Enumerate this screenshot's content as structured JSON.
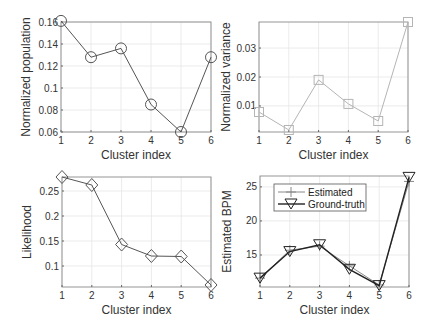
{
  "chart_data": [
    {
      "id": "population",
      "type": "line",
      "title": "",
      "xlabel": "Cluster index",
      "ylabel": "Normalized population",
      "x": [
        1,
        2,
        3,
        4,
        5,
        6
      ],
      "values": [
        0.161,
        0.128,
        0.136,
        0.085,
        0.06,
        0.128
      ],
      "xlim": [
        1,
        6
      ],
      "ylim": [
        0.06,
        0.16
      ],
      "yticks": [
        0.06,
        0.08,
        0.1,
        0.12,
        0.14,
        0.16
      ],
      "ytick_labels": [
        "0.06",
        "0.08",
        "0.1",
        "0.12",
        "0.14",
        "0.16"
      ],
      "xticks": [
        1,
        2,
        3,
        4,
        5,
        6
      ],
      "marker": "circle",
      "color": "#555555",
      "grid": true,
      "box": {
        "x0": 61,
        "y0": 22,
        "x1": 211,
        "y1": 132
      }
    },
    {
      "id": "variance",
      "type": "line",
      "title": "",
      "xlabel": "Cluster index",
      "ylabel": "Normalized variance",
      "x": [
        1,
        2,
        3,
        4,
        5,
        6
      ],
      "values": [
        0.0079,
        0.0017,
        0.019,
        0.0107,
        0.0048,
        0.039
      ],
      "xlim": [
        1,
        6
      ],
      "ylim": [
        0.001,
        0.039
      ],
      "yticks": [
        0.01,
        0.02,
        0.03
      ],
      "ytick_labels": [
        "0.01",
        "0.02",
        "0.03"
      ],
      "xticks": [
        1,
        2,
        3,
        4,
        5,
        6
      ],
      "marker": "square",
      "color": "#b5b5b5",
      "grid": true,
      "box": {
        "x0": 259,
        "y0": 22,
        "x1": 408,
        "y1": 132
      }
    },
    {
      "id": "likelihood",
      "type": "line",
      "title": "",
      "xlabel": "Cluster index",
      "ylabel": "Likelihood",
      "x": [
        1,
        2,
        3,
        4,
        5,
        6
      ],
      "values": [
        0.278,
        0.262,
        0.143,
        0.12,
        0.119,
        0.062
      ],
      "xlim": [
        1,
        6
      ],
      "ylim": [
        0.058,
        0.278
      ],
      "yticks": [
        0.1,
        0.15,
        0.2,
        0.25
      ],
      "ytick_labels": [
        "0.1",
        "0.15",
        "0.2",
        "0.25"
      ],
      "xticks": [
        1,
        2,
        3,
        4,
        5,
        6
      ],
      "marker": "diamond",
      "color": "#555555",
      "grid": true,
      "box": {
        "x0": 62,
        "y0": 177,
        "x1": 211,
        "y1": 287
      }
    },
    {
      "id": "bpm",
      "type": "line",
      "title": "",
      "xlabel": "Cluster index",
      "ylabel": "Estimated BPM",
      "x": [
        1,
        2,
        3,
        4,
        5,
        6
      ],
      "series": [
        {
          "name": "Estimated",
          "values": [
            11.6,
            15.7,
            16.3,
            13.4,
            10.6,
            25.8
          ],
          "marker": "plus",
          "color": "#888888"
        },
        {
          "name": "Ground-truth",
          "values": [
            11.6,
            15.5,
            16.5,
            12.9,
            10.5,
            26.4
          ],
          "marker": "triangle-down",
          "color": "#222222"
        }
      ],
      "xlim": [
        1,
        6
      ],
      "ylim": [
        10.3,
        26.6
      ],
      "yticks": [
        15,
        20,
        25
      ],
      "ytick_labels": [
        "15",
        "20",
        "25"
      ],
      "xticks": [
        1,
        2,
        3,
        4,
        5,
        6
      ],
      "legend_position": "upper-left",
      "grid": true,
      "box": {
        "x0": 260,
        "y0": 176,
        "x1": 409,
        "y1": 287
      }
    }
  ]
}
